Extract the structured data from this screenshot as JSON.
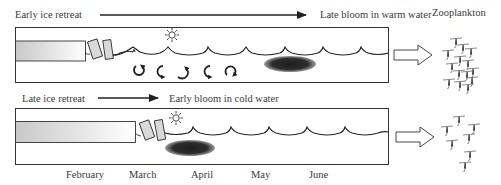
{
  "scenarios": [
    {
      "id": "early-retreat",
      "label_left": "Early ice retreat",
      "label_right": "Late bloom in warm water",
      "bloom_timing": "late",
      "has_circulation_arrows": true,
      "zooplankton_density": "high"
    },
    {
      "id": "late-retreat",
      "label_left": "Late ice retreat",
      "label_right": "Early bloom in cold water",
      "bloom_timing": "early",
      "has_circulation_arrows": false,
      "zooplankton_density": "low"
    }
  ],
  "zooplankton_label": "Zooplankton",
  "months": [
    "February",
    "March",
    "April",
    "May",
    "June"
  ],
  "icons": {
    "sun": "sun-icon",
    "ice": "ice-floe-icon",
    "bloom": "phytoplankton-bloom",
    "circulation": "mixing-arrow-icon",
    "zooplankton": "copepod-icon",
    "flow": "hollow-arrow-icon"
  },
  "colors": {
    "stroke": "#222222",
    "bloom": "#2a2a2a",
    "ice_start": "#cfcfcf",
    "ice_end": "#ffffff",
    "floe": "#d9d9d9"
  }
}
